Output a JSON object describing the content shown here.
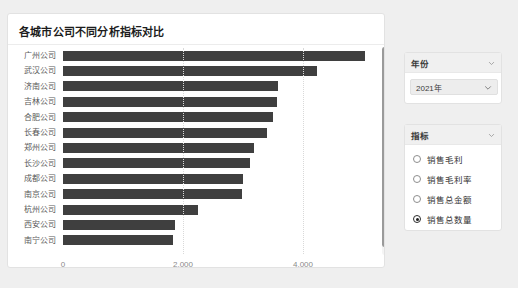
{
  "chart_card": {
    "title": "各城市公司不同分析指标对比"
  },
  "chart_data": {
    "type": "bar",
    "orientation": "horizontal",
    "title": "各城市公司不同分析指标对比",
    "xlabel": "",
    "ylabel": "",
    "xlim": [
      0,
      5300
    ],
    "grid": true,
    "legend": false,
    "xticks": [
      0,
      2000,
      4000
    ],
    "xtick_labels": [
      "0",
      "2,000",
      "4,000"
    ],
    "categories": [
      "广州公司",
      "武汉公司",
      "济南公司",
      "吉林公司",
      "合肥公司",
      "长春公司",
      "郑州公司",
      "长沙公司",
      "成都公司",
      "南京公司",
      "杭州公司",
      "西安公司",
      "南宁公司"
    ],
    "values": [
      5040,
      4230,
      3580,
      3560,
      3500,
      3400,
      3180,
      3110,
      3000,
      2980,
      2250,
      1870,
      1830
    ],
    "series_name": "销售总数量",
    "bar_color": "#3f3f3f"
  },
  "year_panel": {
    "header": "年份",
    "chevron_icon": "chevron-down-icon",
    "selected": "2021年",
    "dropdown_icon": "chevron-down-icon"
  },
  "metric_panel": {
    "header": "指标",
    "chevron_icon": "chevron-down-icon",
    "options": [
      {
        "label": "销售毛利",
        "checked": false
      },
      {
        "label": "销售毛利率",
        "checked": false
      },
      {
        "label": "销售总金额",
        "checked": false
      },
      {
        "label": "销售总数量",
        "checked": true
      }
    ]
  },
  "scrollbar": {
    "name": "chart-vertical-scrollbar"
  },
  "colors": {
    "bar": "#3f3f3f",
    "panel_head_bg": "#f0f0f0",
    "page_bg": "#efefef",
    "card_bg": "#ffffff",
    "grid": "#d9d9d9"
  }
}
